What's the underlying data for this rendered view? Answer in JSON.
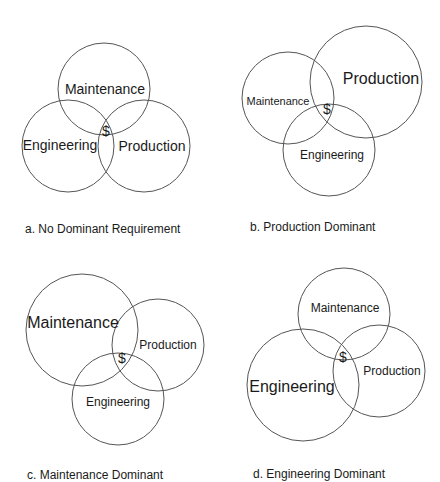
{
  "figure": {
    "panels": [
      {
        "id": "a",
        "caption": "a. No Dominant Requirement",
        "center_symbol": "$",
        "circles": [
          {
            "label": "Maintenance",
            "cx": 104,
            "cy": 89,
            "r": 46,
            "label_x": 105,
            "label_y": 94,
            "font_size": 14
          },
          {
            "label": "Engineering",
            "cx": 68,
            "cy": 146,
            "r": 46,
            "label_x": 60,
            "label_y": 150,
            "font_size": 14
          },
          {
            "label": "Production",
            "cx": 144,
            "cy": 146,
            "r": 46,
            "label_x": 152,
            "label_y": 151,
            "font_size": 14
          }
        ],
        "symbol_x": 106,
        "symbol_y": 136,
        "symbol_size": 14,
        "caption_x": 25,
        "caption_y": 222
      },
      {
        "id": "b",
        "caption": "b. Production Dominant",
        "center_symbol": "$",
        "circles": [
          {
            "label": "Maintenance",
            "cx": 288,
            "cy": 98,
            "r": 46,
            "label_x": 278,
            "label_y": 105,
            "font_size": 11
          },
          {
            "label": "Production",
            "cx": 366,
            "cy": 82,
            "r": 56,
            "label_x": 381,
            "label_y": 84,
            "font_size": 16
          },
          {
            "label": "Engineering",
            "cx": 329,
            "cy": 150,
            "r": 46,
            "label_x": 332,
            "label_y": 159,
            "font_size": 12
          }
        ],
        "symbol_x": 327,
        "symbol_y": 114,
        "symbol_size": 14,
        "caption_x": 250,
        "caption_y": 220
      },
      {
        "id": "c",
        "caption": "c. Maintenance Dominant",
        "center_symbol": "$",
        "circles": [
          {
            "label": "Maintenance",
            "cx": 82,
            "cy": 330,
            "r": 56,
            "label_x": 73,
            "label_y": 328,
            "font_size": 16
          },
          {
            "label": "Production",
            "cx": 158,
            "cy": 345,
            "r": 46,
            "label_x": 168,
            "label_y": 349,
            "font_size": 12
          },
          {
            "label": "Engineering",
            "cx": 118,
            "cy": 399,
            "r": 46,
            "label_x": 118,
            "label_y": 406,
            "font_size": 12
          }
        ],
        "symbol_x": 122,
        "symbol_y": 363,
        "symbol_size": 14,
        "caption_x": 27,
        "caption_y": 468
      },
      {
        "id": "d",
        "caption": "d. Engineering Dominant",
        "center_symbol": "$",
        "circles": [
          {
            "label": "Maintenance",
            "cx": 344,
            "cy": 314,
            "r": 46,
            "label_x": 345,
            "label_y": 312,
            "font_size": 12
          },
          {
            "label": "Production",
            "cx": 379,
            "cy": 371,
            "r": 46,
            "label_x": 392,
            "label_y": 375,
            "font_size": 12
          },
          {
            "label": "Engineering",
            "cx": 303,
            "cy": 385,
            "r": 56,
            "label_x": 292,
            "label_y": 392,
            "font_size": 16
          }
        ],
        "symbol_x": 343,
        "symbol_y": 362,
        "symbol_size": 14,
        "caption_x": 253,
        "caption_y": 467
      }
    ]
  },
  "colors": {
    "stroke": "#555555",
    "text": "#1a1a1a",
    "background": "#ffffff"
  }
}
